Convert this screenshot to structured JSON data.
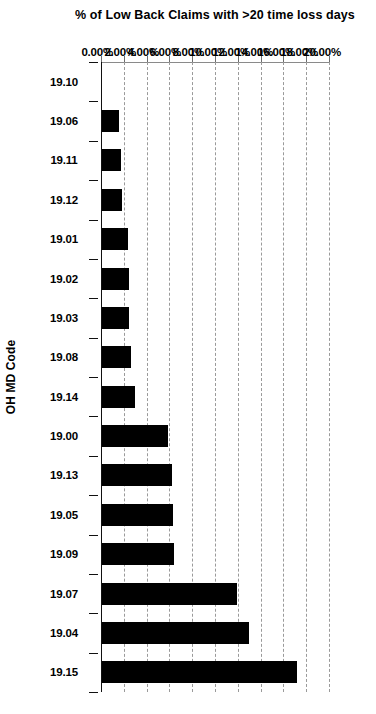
{
  "chart_data": {
    "type": "bar",
    "title": "",
    "subtitle": "",
    "orientation": "vertical-column-chart-rotated-90deg",
    "xlabel": "OH MD Code",
    "ylabel": "% of Low Back Claims with >20 time loss days",
    "categories": [
      "19.10",
      "19.06",
      "19.11",
      "19.12",
      "19.01",
      "19.02",
      "19.03",
      "19.08",
      "19.14",
      "19.00",
      "19.13",
      "19.05",
      "19.09",
      "19.07",
      "19.04",
      "19.15"
    ],
    "values": [
      0.0,
      1.55,
      1.75,
      1.8,
      2.4,
      2.45,
      2.5,
      2.6,
      2.95,
      5.9,
      6.2,
      6.35,
      6.4,
      11.9,
      13.0,
      17.2
    ],
    "value_suffix": "%",
    "ylim": [
      0,
      20
    ],
    "ytick_values": [
      0,
      2,
      4,
      6,
      8,
      10,
      12,
      14,
      16,
      18,
      20
    ],
    "ytick_labels": [
      "0.00%",
      "2.00%",
      "4.00%",
      "6.00%",
      "8.00%",
      "10.00%",
      "12.00%",
      "14.00%",
      "16.00%",
      "18.00%",
      "20.00%"
    ],
    "grid": true,
    "grid_style": "dashed",
    "legend": false,
    "legend_position": "none",
    "series": [
      {
        "name": "% of Low Back Claims with >20 time loss days",
        "values": [
          0.0,
          1.55,
          1.75,
          1.8,
          2.4,
          2.45,
          2.5,
          2.6,
          2.95,
          5.9,
          6.2,
          6.35,
          6.4,
          11.9,
          13.0,
          17.2
        ]
      }
    ],
    "colors": {
      "bar": "#000000",
      "grid": "#9a9a9a",
      "axis": "#111111",
      "background": "#ffffff",
      "text": "#000000"
    }
  }
}
